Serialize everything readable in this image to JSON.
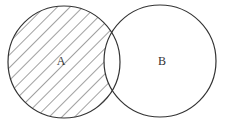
{
  "diagram": {
    "type": "venn",
    "shaded_region": "A - B",
    "colors": {
      "stroke": "#333333",
      "hatch": "#444444",
      "background": "#ffffff"
    },
    "sets": [
      {
        "id": "A",
        "label": "A",
        "cx": 64,
        "cy": 62,
        "r": 56,
        "label_x": 61,
        "label_y": 65
      },
      {
        "id": "B",
        "label": "B",
        "cx": 160,
        "cy": 61,
        "r": 56,
        "label_x": 162,
        "label_y": 65
      }
    ]
  }
}
